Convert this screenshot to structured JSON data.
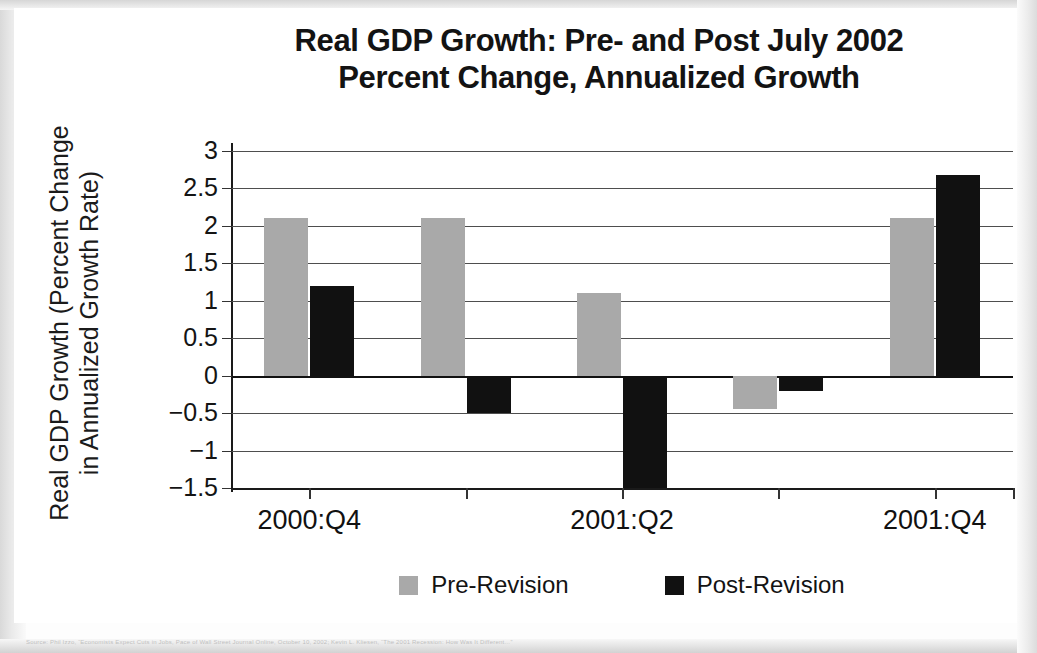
{
  "chart_data": {
    "type": "bar",
    "title": "Real GDP Growth: Pre- and Post July 2002",
    "subtitle": "Percent Change, Annualized Growth",
    "title_line1": "Real GDP Growth: Pre- and Post July 2002",
    "title_line2": "Percent Change, Annualized Growth",
    "ylabel_line1": "Real GDP Growth (Percent Change",
    "ylabel_line2": "in Annualized Growth Rate)",
    "xlabel": "",
    "categories": [
      "2000:Q4",
      "2001:Q1",
      "2001:Q2",
      "2001:Q3",
      "2001:Q4"
    ],
    "tick_labels": [
      "2000:Q4",
      "",
      "2001:Q2",
      "",
      "2001:Q4"
    ],
    "series": [
      {
        "name": "Pre-Revision",
        "color": "#a9a9a9",
        "values": [
          2.1,
          2.1,
          1.1,
          -0.45,
          2.1
        ]
      },
      {
        "name": "Post-Revision",
        "color": "#111111",
        "values": [
          1.2,
          -0.5,
          -1.5,
          -0.2,
          2.68
        ]
      }
    ],
    "ylim": [
      -1.5,
      3
    ],
    "ytick_values": [
      3,
      2.5,
      2,
      1.5,
      1,
      0.5,
      0,
      -0.5,
      -1,
      -1.5
    ],
    "ytick_labels": [
      "3",
      "2.5",
      "2",
      "1.5",
      "1",
      "0.5",
      "0",
      "−0.5",
      "−1",
      "−1.5"
    ],
    "grid": true,
    "legend_position": "bottom",
    "legend": [
      "Pre-Revision",
      "Post-Revision"
    ]
  },
  "source_note": "Source: Phil Izzo, “Economists Expect Cuts in Jobs, Pace of Wall Street Journal Online, October 10, 2002; Kevin L. Kliesen, “The 2001 Recession: How Was It Different…”"
}
